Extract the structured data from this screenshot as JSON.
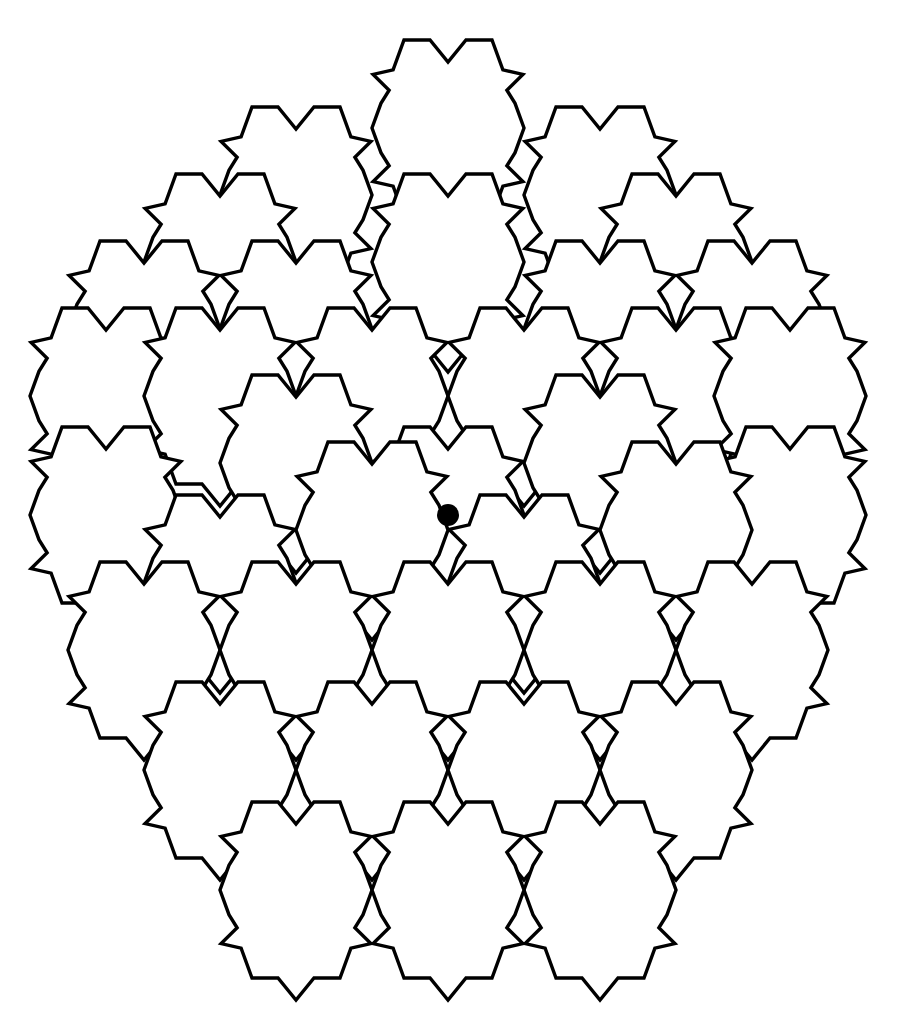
{
  "figure": {
    "canvas_width": 902,
    "canvas_height": 1036,
    "background_color": "#ffffff",
    "stroke_color": "#000000",
    "stroke_width": 3.4,
    "fill_color": "#ffffff"
  },
  "tiling": {
    "type": "modified-hexagon",
    "description": "Flat-topped hexagons whose six edges each carry a matching notch/bump so neighbouring tiles interlock.",
    "hex_half_width": 76,
    "hex_half_height": 88,
    "hex_shoulder": 44,
    "pitch_x": 152,
    "pitch_y": 133,
    "row_offset_x": 76,
    "notch_depth": 22,
    "notch_half_width": 18,
    "jog_depth": 15,
    "jog_run": 20,
    "tile_count": 37,
    "centers": [
      {
        "cx": 448,
        "cy": 128,
        "label": "tile-r0-c0"
      },
      {
        "cx": 296,
        "cy": 195,
        "label": "tile-r1-c0"
      },
      {
        "cx": 600,
        "cy": 195,
        "label": "tile-r1-c1"
      },
      {
        "cx": 220,
        "cy": 262,
        "label": "tile-r2-c0"
      },
      {
        "cx": 448,
        "cy": 262,
        "label": "tile-r2-c1"
      },
      {
        "cx": 676,
        "cy": 262,
        "label": "tile-r2-c2"
      },
      {
        "cx": 144,
        "cy": 329,
        "label": "tile-r3-c0"
      },
      {
        "cx": 296,
        "cy": 329,
        "label": "tile-r3-c1"
      },
      {
        "cx": 600,
        "cy": 329,
        "label": "tile-r3-c2"
      },
      {
        "cx": 752,
        "cy": 329,
        "label": "tile-r3-c3"
      },
      {
        "cx": 106,
        "cy": 396,
        "label": "tile-r4-c0"
      },
      {
        "cx": 220,
        "cy": 396,
        "label": "tile-r4-c1"
      },
      {
        "cx": 372,
        "cy": 396,
        "label": "tile-r4-c2"
      },
      {
        "cx": 524,
        "cy": 396,
        "label": "tile-r4-c3"
      },
      {
        "cx": 676,
        "cy": 396,
        "label": "tile-r4-c4"
      },
      {
        "cx": 790,
        "cy": 396,
        "label": "tile-r4-c5"
      },
      {
        "cx": 106,
        "cy": 515,
        "label": "tile-r5-c0"
      },
      {
        "cx": 296,
        "cy": 463,
        "label": "tile-r5-c1"
      },
      {
        "cx": 448,
        "cy": 515,
        "label": "tile-r5-c2"
      },
      {
        "cx": 600,
        "cy": 463,
        "label": "tile-r5-c3"
      },
      {
        "cx": 790,
        "cy": 515,
        "label": "tile-r5-c4"
      },
      {
        "cx": 220,
        "cy": 583,
        "label": "tile-r6-c0"
      },
      {
        "cx": 372,
        "cy": 530,
        "label": "tile-r6-c1"
      },
      {
        "cx": 524,
        "cy": 583,
        "label": "tile-r6-c2"
      },
      {
        "cx": 676,
        "cy": 530,
        "label": "tile-r6-c3"
      },
      {
        "cx": 144,
        "cy": 650,
        "label": "tile-r7-c0"
      },
      {
        "cx": 296,
        "cy": 650,
        "label": "tile-r7-c1"
      },
      {
        "cx": 448,
        "cy": 650,
        "label": "tile-r7-c2"
      },
      {
        "cx": 600,
        "cy": 650,
        "label": "tile-r7-c3"
      },
      {
        "cx": 752,
        "cy": 650,
        "label": "tile-r7-c4"
      },
      {
        "cx": 220,
        "cy": 770,
        "label": "tile-r8-c0"
      },
      {
        "cx": 372,
        "cy": 770,
        "label": "tile-r8-c1"
      },
      {
        "cx": 524,
        "cy": 770,
        "label": "tile-r8-c2"
      },
      {
        "cx": 676,
        "cy": 770,
        "label": "tile-r8-c3"
      },
      {
        "cx": 296,
        "cy": 890,
        "label": "tile-r9-c0"
      },
      {
        "cx": 600,
        "cy": 890,
        "label": "tile-r9-c1"
      },
      {
        "cx": 448,
        "cy": 890,
        "label": "tile-r10-c0"
      }
    ]
  },
  "center_marker": {
    "name": "center-dot",
    "cx": 448,
    "cy": 515,
    "r": 11,
    "color": "#000000"
  }
}
